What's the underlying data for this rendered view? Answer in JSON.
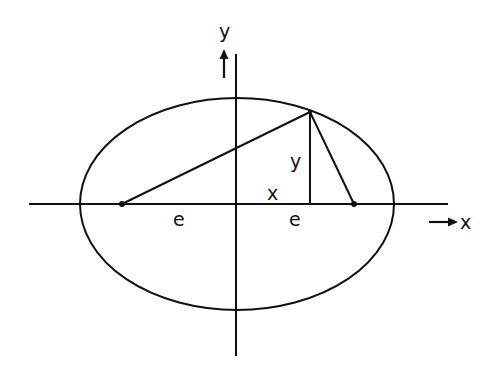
{
  "figure": {
    "colors": {
      "stroke": "#111111",
      "background": "#ffffff"
    },
    "axes": {
      "x_label": "x",
      "y_label": "y",
      "x_arrow": "→",
      "y_arrow": "↑"
    },
    "labels": {
      "point_x": "x",
      "point_y": "y",
      "left_focus_distance": "e",
      "right_focus_distance": "e"
    },
    "geometry": {
      "ellipse": {
        "cx": 237,
        "cy": 204,
        "rx": 157,
        "ry": 106
      },
      "left_focus": {
        "x": 122,
        "y": 204
      },
      "right_focus": {
        "x": 354,
        "y": 204
      },
      "point_on_ellipse": {
        "x": 310,
        "y": 112
      },
      "x_axis": {
        "x1": 29,
        "x2": 448,
        "y": 204
      },
      "y_axis": {
        "x": 236,
        "y1": 54,
        "y2": 356
      }
    }
  }
}
